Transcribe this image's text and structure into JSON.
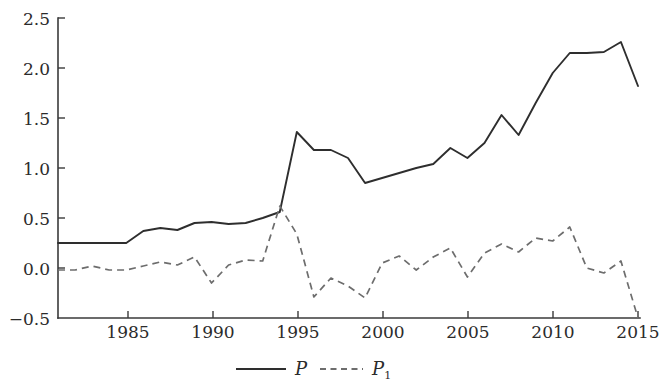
{
  "chart_data": {
    "type": "line",
    "title": "",
    "xlabel": "",
    "ylabel": "",
    "xlim": [
      1981,
      2015
    ],
    "ylim": [
      -0.5,
      2.5
    ],
    "grid": false,
    "legend_position": "bottom-center",
    "x": [
      1981,
      1982,
      1983,
      1984,
      1985,
      1986,
      1987,
      1988,
      1989,
      1990,
      1991,
      1992,
      1993,
      1994,
      1995,
      1996,
      1997,
      1998,
      1999,
      2000,
      2001,
      2002,
      2003,
      2004,
      2005,
      2006,
      2007,
      2008,
      2009,
      2010,
      2011,
      2012,
      2013,
      2014,
      2015
    ],
    "xticks": [
      1985,
      1990,
      1995,
      2000,
      2005,
      2010,
      2015
    ],
    "xtick_labels": [
      "1985",
      "1990",
      "1995",
      "2000",
      "2005",
      "2010",
      "2015"
    ],
    "yticks": [
      -0.5,
      0.0,
      0.5,
      1.0,
      1.5,
      2.0,
      2.5
    ],
    "ytick_labels": [
      "−0.5",
      "0.0",
      "0.5",
      "1.0",
      "1.5",
      "2.0",
      "2.5"
    ],
    "series": [
      {
        "name": "P",
        "style": "solid",
        "color": "#2e2e2e",
        "values": [
          0.25,
          0.25,
          0.25,
          0.25,
          0.25,
          0.37,
          0.4,
          0.38,
          0.45,
          0.46,
          0.44,
          0.45,
          0.5,
          0.56,
          1.36,
          1.18,
          1.18,
          1.1,
          0.85,
          0.9,
          0.95,
          1.0,
          1.04,
          1.2,
          1.1,
          1.25,
          1.53,
          1.33,
          1.65,
          1.95,
          2.15,
          2.15,
          2.16,
          2.26,
          1.82
        ]
      },
      {
        "name": "P1",
        "style": "dashed",
        "color": "#6d6d6d",
        "values": [
          -0.02,
          -0.02,
          0.02,
          -0.02,
          -0.02,
          0.02,
          0.06,
          0.03,
          0.11,
          -0.15,
          0.03,
          0.08,
          0.07,
          0.62,
          0.34,
          -0.29,
          -0.1,
          -0.18,
          -0.3,
          0.05,
          0.12,
          -0.02,
          0.11,
          0.2,
          -0.09,
          0.15,
          0.24,
          0.16,
          0.3,
          0.27,
          0.41,
          0.0,
          -0.05,
          0.07,
          -0.5
        ]
      }
    ],
    "legend": [
      {
        "name": "P",
        "base": "P",
        "subscript": "",
        "style": "solid"
      },
      {
        "name": "P1",
        "base": "P",
        "subscript": "1",
        "style": "dashed"
      }
    ]
  },
  "colors": {
    "background": "#ffffff",
    "axis": "#3a3a3a",
    "text": "#2b2b2b",
    "series_p": "#2e2e2e",
    "series_p1": "#6d6d6d"
  }
}
